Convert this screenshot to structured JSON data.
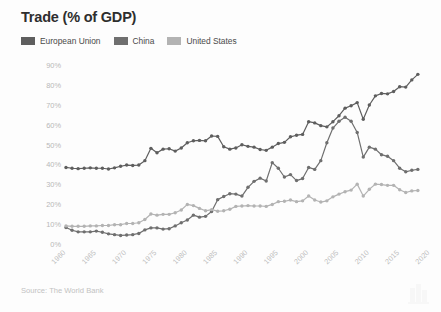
{
  "header": {
    "title": "Trade (% of GDP)"
  },
  "legend": {
    "position": "top-left",
    "items": [
      {
        "label": "European Union",
        "color": "#5e5e5e"
      },
      {
        "label": "China",
        "color": "#6f6f6f"
      },
      {
        "label": "United States",
        "color": "#b3b3b3"
      }
    ]
  },
  "footer": {
    "source": "Source: The World Bank"
  },
  "chart_data": {
    "type": "line",
    "title": "Trade (% of GDP)",
    "xlabel": "",
    "ylabel": "",
    "grid": false,
    "legend_position": "top-left",
    "markers": true,
    "xlim": [
      1960,
      2020
    ],
    "ylim": [
      0,
      90
    ],
    "ytick_labels": [
      "0%",
      "10%",
      "20%",
      "30%",
      "40%",
      "50%",
      "60%",
      "70%",
      "80%",
      "90%"
    ],
    "ytick_values": [
      0,
      10,
      20,
      30,
      40,
      50,
      60,
      70,
      80,
      90
    ],
    "xtick_values": [
      1960,
      1965,
      1970,
      1975,
      1980,
      1985,
      1990,
      1995,
      2000,
      2005,
      2010,
      2015,
      2020
    ],
    "xtick_labels": [
      "1960",
      "1965",
      "1970",
      "1975",
      "1980",
      "1985",
      "1990",
      "1995",
      "2000",
      "2005",
      "2010",
      "2015",
      "2020"
    ],
    "x": [
      1960,
      1961,
      1962,
      1963,
      1964,
      1965,
      1966,
      1967,
      1968,
      1969,
      1970,
      1971,
      1972,
      1973,
      1974,
      1975,
      1976,
      1977,
      1978,
      1979,
      1980,
      1981,
      1982,
      1983,
      1984,
      1985,
      1986,
      1987,
      1988,
      1989,
      1990,
      1991,
      1992,
      1993,
      1994,
      1995,
      1996,
      1997,
      1998,
      1999,
      2000,
      2001,
      2002,
      2003,
      2004,
      2005,
      2006,
      2007,
      2008,
      2009,
      2010,
      2011,
      2012,
      2013,
      2014,
      2015,
      2016,
      2017,
      2018
    ],
    "series": [
      {
        "name": "European Union",
        "color": "#5e5e5e",
        "values": [
          39.0,
          38.6,
          38.4,
          38.6,
          38.8,
          38.6,
          38.6,
          38.2,
          38.8,
          39.6,
          40.2,
          40.0,
          40.2,
          42.4,
          48.6,
          46.4,
          48.2,
          48.4,
          47.2,
          48.8,
          51.4,
          52.4,
          52.6,
          52.4,
          54.8,
          54.6,
          49.4,
          48.2,
          48.8,
          50.4,
          49.6,
          49.2,
          48.0,
          47.6,
          49.2,
          51.0,
          51.6,
          54.4,
          55.2,
          55.6,
          62.0,
          61.4,
          60.0,
          59.4,
          62.0,
          65.0,
          68.8,
          70.0,
          71.6,
          63.2,
          70.4,
          75.0,
          76.2,
          76.0,
          77.2,
          79.6,
          79.4,
          83.0,
          85.8
        ]
      },
      {
        "name": "China",
        "color": "#6f6f6f",
        "values": [
          8.8,
          7.4,
          6.6,
          6.6,
          6.6,
          7.0,
          6.4,
          5.6,
          5.2,
          4.8,
          5.0,
          5.2,
          5.8,
          7.6,
          8.6,
          8.6,
          8.0,
          8.2,
          9.6,
          11.2,
          12.6,
          15.0,
          14.0,
          14.4,
          16.8,
          22.8,
          24.4,
          25.8,
          25.6,
          24.6,
          29.0,
          32.0,
          33.6,
          32.2,
          41.4,
          38.6,
          34.2,
          35.4,
          32.4,
          33.4,
          39.0,
          38.0,
          42.4,
          51.4,
          58.8,
          62.2,
          64.2,
          62.2,
          56.6,
          44.2,
          49.2,
          48.2,
          45.4,
          44.6,
          42.4,
          38.6,
          36.8,
          37.6,
          38.0
        ]
      },
      {
        "name": "United States",
        "color": "#b3b3b3",
        "values": [
          9.6,
          9.4,
          9.4,
          9.4,
          9.6,
          9.6,
          9.8,
          9.8,
          10.2,
          10.2,
          10.8,
          10.8,
          11.2,
          12.8,
          15.6,
          15.0,
          15.4,
          15.4,
          16.2,
          17.6,
          20.4,
          19.8,
          18.4,
          17.2,
          17.8,
          17.0,
          17.2,
          18.0,
          19.4,
          19.6,
          19.8,
          19.6,
          19.6,
          19.4,
          20.4,
          21.8,
          22.0,
          22.6,
          21.8,
          22.2,
          24.6,
          22.6,
          21.6,
          22.2,
          24.2,
          25.6,
          26.8,
          27.6,
          30.6,
          24.6,
          28.0,
          30.6,
          30.4,
          30.0,
          30.0,
          27.8,
          26.4,
          27.2,
          27.4
        ]
      }
    ]
  }
}
